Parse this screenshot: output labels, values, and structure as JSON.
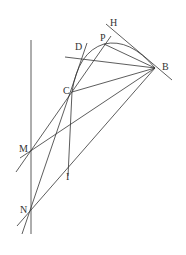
{
  "diagram": {
    "labels": {
      "H": "H",
      "P": "P",
      "D": "D",
      "B": "B",
      "C": "C",
      "M": "M",
      "I": "I",
      "N": "N"
    }
  }
}
